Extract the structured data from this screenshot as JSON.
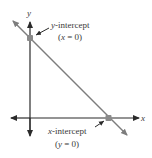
{
  "diagram": {
    "axes": {
      "x_label": "x",
      "y_label": "y"
    },
    "annotations": {
      "y_intercept": {
        "var": "y",
        "title": "-intercept",
        "condition_var": "x",
        "condition_rest": " = 0)",
        "condition_open": "("
      },
      "x_intercept": {
        "var": "x",
        "title": "-intercept",
        "condition_var": "y",
        "condition_rest": " = 0)",
        "condition_open": "("
      }
    },
    "colors": {
      "axis": "#2a2a2a",
      "line": "#7d7d7d",
      "point": "#8a8a8a",
      "text": "#3a3a3a"
    }
  }
}
